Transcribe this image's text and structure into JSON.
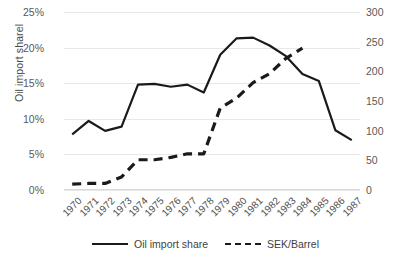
{
  "chart_data": {
    "type": "line",
    "title": "",
    "xlabel": "",
    "ylabel": "Oil import sharel",
    "y2label": "",
    "grid": true,
    "legend_position": "bottom",
    "categories": [
      "1970",
      "1971",
      "1972",
      "1973",
      "1974",
      "1975",
      "1976",
      "1977",
      "1978",
      "1979",
      "1980",
      "1981",
      "1982",
      "1983",
      "1984",
      "1985",
      "1986",
      "1987"
    ],
    "ylim": [
      0,
      25
    ],
    "y2lim": [
      0,
      300
    ],
    "yticks": [
      "0%",
      "5%",
      "10%",
      "15%",
      "20%",
      "25%"
    ],
    "ytick_values": [
      0,
      5,
      10,
      15,
      20,
      25
    ],
    "y2ticks": [
      "0",
      "50",
      "100",
      "150",
      "200",
      "250",
      "300"
    ],
    "y2tick_values": [
      0,
      50,
      100,
      150,
      200,
      250,
      300
    ],
    "series": [
      {
        "name": "Oil import share",
        "axis": "left",
        "style": "solid",
        "color": "#1a1a1a",
        "values": [
          7.8,
          9.7,
          8.3,
          8.9,
          14.8,
          14.9,
          14.5,
          14.8,
          13.7,
          19.0,
          21.3,
          21.4,
          20.3,
          18.8,
          16.3,
          15.3,
          8.4,
          7.0
        ]
      },
      {
        "name": "SEK/Barrel",
        "axis": "right",
        "style": "dashed",
        "color": "#1a1a1a",
        "values": [
          10,
          11,
          11,
          22,
          51,
          51,
          55,
          61,
          61,
          138,
          155,
          181,
          196,
          222,
          239,
          null,
          null,
          null
        ]
      }
    ]
  },
  "legend": {
    "items": [
      {
        "label": "Oil import share",
        "style": "solid"
      },
      {
        "label": "SEK/Barrel",
        "style": "dashed"
      }
    ]
  }
}
